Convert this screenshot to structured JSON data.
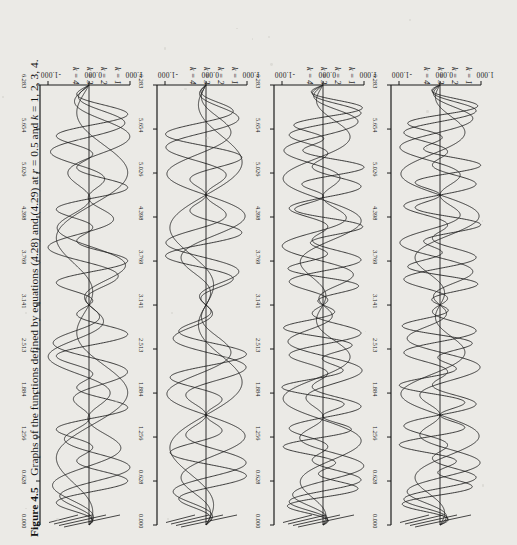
{
  "figure": {
    "number_label": "Figure 4.5",
    "caption_text": "Graphs of the functions defined by equations (4.28) and (4.29) at ",
    "caption_r": "r",
    "caption_mid": " = 0.5 and ",
    "caption_k": "k",
    "caption_tail": " = 1, 2, 3, 4.",
    "orientation": "rotated-180",
    "background_color": "#ebeae6",
    "ink_color": "#1b1b1b"
  },
  "axes": {
    "x_ticks": [
      "0.000",
      "0.628",
      "1.256",
      "1.884",
      "2.513",
      "3.141",
      "3.769",
      "4.398",
      "5.026",
      "5.654",
      "6.283"
    ],
    "x_values": [
      0.0,
      0.628,
      1.256,
      1.884,
      2.513,
      3.141,
      3.769,
      4.398,
      5.026,
      5.654,
      6.283
    ],
    "y_ticks": [
      "1.000",
      "0.000",
      "-1.000"
    ],
    "y_values": [
      1.0,
      0.0,
      -1.0
    ],
    "xlim": [
      0.0,
      6.283
    ],
    "ylim": [
      -1.0,
      1.0
    ]
  },
  "legend": {
    "entries": [
      "k = 1",
      "k = 2",
      "k = 3",
      "k = 4"
    ],
    "position": "top-left-of-panel",
    "leader_lines": true
  },
  "chart_data": {
    "type": "line",
    "title": "Graphs of the functions defined by equations (4.28) and (4.29) at r = 0.5 and k = 1, 2, 3, 4",
    "xlabel": "",
    "ylabel": "",
    "xlim": [
      0.0,
      6.283
    ],
    "ylim": [
      -1.0,
      1.0
    ],
    "grid": false,
    "legend_position": "top-left",
    "x_tick_labels": [
      "0.000",
      "0.628",
      "1.256",
      "1.884",
      "2.513",
      "3.141",
      "3.769",
      "4.398",
      "5.026",
      "5.654",
      "6.283"
    ],
    "y_tick_labels": [
      "1.000",
      "0.000",
      "-1.000"
    ],
    "panel_count": 4,
    "parameter_r": 0.5,
    "k_values": [
      1,
      2,
      3,
      4
    ],
    "panels": [
      {
        "index": 0,
        "name": "panel-1",
        "series": [
          {
            "name": "k = 1",
            "k": 1,
            "form": "cos",
            "freq": 5.0,
            "env": "sin",
            "env_freq": 1.0,
            "amp": 1.0,
            "phase": 0.0
          },
          {
            "name": "k = 2",
            "k": 2,
            "form": "cos",
            "freq": 7.0,
            "env": "sin",
            "env_freq": 2.0,
            "amp": 1.0,
            "phase": 0.0
          },
          {
            "name": "k = 3",
            "k": 3,
            "form": "cos",
            "freq": 9.0,
            "env": "sin",
            "env_freq": 3.0,
            "amp": 1.0,
            "phase": 0.0
          },
          {
            "name": "k = 4",
            "k": 4,
            "form": "cos",
            "freq": 11.0,
            "env": "sin",
            "env_freq": 4.0,
            "amp": 1.0,
            "phase": 0.0
          }
        ]
      },
      {
        "index": 1,
        "name": "panel-2",
        "series": [
          {
            "name": "k = 1",
            "k": 1,
            "form": "cos",
            "freq": 5.0,
            "env": "sin",
            "env_freq": 1.0,
            "amp": 1.0,
            "phase": 0.35
          },
          {
            "name": "k = 2",
            "k": 2,
            "form": "cos",
            "freq": 7.0,
            "env": "sin",
            "env_freq": 2.0,
            "amp": 1.0,
            "phase": 0.35
          },
          {
            "name": "k = 3",
            "k": 3,
            "form": "cos",
            "freq": 9.0,
            "env": "sin",
            "env_freq": 3.0,
            "amp": 1.0,
            "phase": 0.35
          },
          {
            "name": "k = 4",
            "k": 4,
            "form": "cos",
            "freq": 11.0,
            "env": "sin",
            "env_freq": 4.0,
            "amp": 1.0,
            "phase": 0.35
          }
        ]
      },
      {
        "index": 2,
        "name": "panel-3",
        "series": [
          {
            "name": "k = 1",
            "k": 1,
            "form": "cos",
            "freq": 3.0,
            "env": "sin",
            "env_freq": 1.0,
            "amp": 1.0,
            "phase": 0.0
          },
          {
            "name": "k = 2",
            "k": 2,
            "form": "cos",
            "freq": 5.0,
            "env": "sin",
            "env_freq": 1.0,
            "amp": 1.0,
            "phase": 0.0
          },
          {
            "name": "k = 3",
            "k": 3,
            "form": "cos",
            "freq": 7.0,
            "env": "sin",
            "env_freq": 2.0,
            "amp": 1.0,
            "phase": 0.0
          },
          {
            "name": "k = 4",
            "k": 4,
            "form": "cos",
            "freq": 9.0,
            "env": "sin",
            "env_freq": 2.0,
            "amp": 1.0,
            "phase": 0.0
          }
        ]
      },
      {
        "index": 3,
        "name": "panel-4",
        "series": [
          {
            "name": "k = 1",
            "k": 1,
            "form": "cos",
            "freq": 3.0,
            "env": "sin",
            "env_freq": 1.0,
            "amp": 1.0,
            "phase": 0.5
          },
          {
            "name": "k = 2",
            "k": 2,
            "form": "cos",
            "freq": 5.0,
            "env": "sin",
            "env_freq": 2.0,
            "amp": 1.0,
            "phase": 0.5
          },
          {
            "name": "k = 3",
            "k": 3,
            "form": "cos",
            "freq": 7.0,
            "env": "sin",
            "env_freq": 2.0,
            "amp": 1.0,
            "phase": 0.5
          },
          {
            "name": "k = 4",
            "k": 4,
            "form": "cos",
            "freq": 9.0,
            "env": "sin",
            "env_freq": 3.0,
            "amp": 1.0,
            "phase": 0.5
          }
        ]
      }
    ]
  }
}
